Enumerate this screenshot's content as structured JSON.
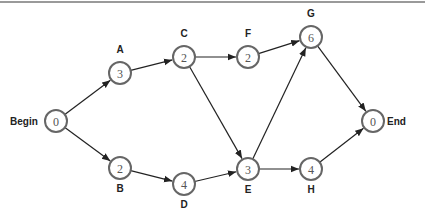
{
  "diagram": {
    "type": "activity-on-node network",
    "nodes": [
      {
        "id": "Begin",
        "label": "Begin",
        "value": "0",
        "x": 56,
        "y": 121,
        "lx": -46,
        "ly": 4,
        "anchor": "start"
      },
      {
        "id": "A",
        "label": "A",
        "value": "3",
        "x": 120,
        "y": 73,
        "lx": 0,
        "ly": -20,
        "anchor": "middle"
      },
      {
        "id": "B",
        "label": "B",
        "value": "2",
        "x": 120,
        "y": 168,
        "lx": 0,
        "ly": 24,
        "anchor": "middle"
      },
      {
        "id": "C",
        "label": "C",
        "value": "2",
        "x": 184,
        "y": 57,
        "lx": 0,
        "ly": -20,
        "anchor": "middle"
      },
      {
        "id": "D",
        "label": "D",
        "value": "4",
        "x": 184,
        "y": 184,
        "lx": 0,
        "ly": 24,
        "anchor": "middle"
      },
      {
        "id": "F",
        "label": "F",
        "value": "2",
        "x": 248,
        "y": 57,
        "lx": 0,
        "ly": -20,
        "anchor": "middle"
      },
      {
        "id": "E",
        "label": "E",
        "value": "3",
        "x": 248,
        "y": 169,
        "lx": 0,
        "ly": 24,
        "anchor": "middle"
      },
      {
        "id": "G",
        "label": "G",
        "value": "6",
        "x": 311,
        "y": 37,
        "lx": 0,
        "ly": -20,
        "anchor": "middle"
      },
      {
        "id": "H",
        "label": "H",
        "value": "4",
        "x": 311,
        "y": 169,
        "lx": 0,
        "ly": 24,
        "anchor": "middle"
      },
      {
        "id": "End",
        "label": "End",
        "value": "0",
        "x": 373,
        "y": 121,
        "lx": 14,
        "ly": 4,
        "anchor": "start"
      }
    ],
    "edges": [
      [
        "Begin",
        "A"
      ],
      [
        "Begin",
        "B"
      ],
      [
        "A",
        "C"
      ],
      [
        "B",
        "D"
      ],
      [
        "C",
        "F"
      ],
      [
        "C",
        "E"
      ],
      [
        "D",
        "E"
      ],
      [
        "F",
        "G"
      ],
      [
        "E",
        "G"
      ],
      [
        "E",
        "H"
      ],
      [
        "G",
        "End"
      ],
      [
        "H",
        "End"
      ]
    ]
  }
}
